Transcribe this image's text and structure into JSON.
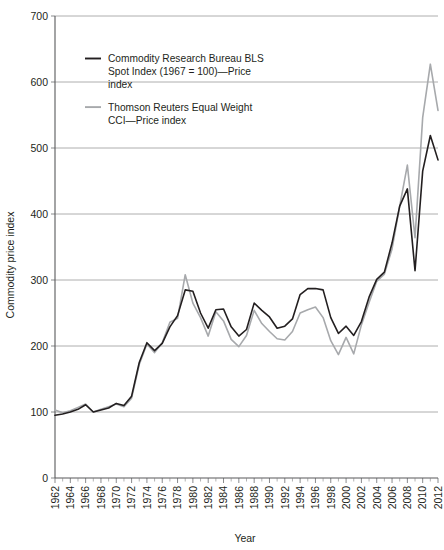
{
  "chart_data": {
    "type": "line",
    "title": "",
    "xlabel": "Year",
    "ylabel": "Commodity price index",
    "xlim": [
      1962,
      2012
    ],
    "ylim": [
      0,
      700
    ],
    "ytick_labels": [
      "0",
      "100",
      "200",
      "300",
      "400",
      "500",
      "600",
      "700"
    ],
    "ytick_values": [
      0,
      100,
      200,
      300,
      400,
      500,
      600,
      700
    ],
    "xtick_labels": [
      "1962",
      "1964",
      "1966",
      "1968",
      "1970",
      "1972",
      "1974",
      "1976",
      "1978",
      "1980",
      "1982",
      "1984",
      "1986",
      "1988",
      "1990",
      "1992",
      "1994",
      "1996",
      "1998",
      "2000",
      "2002",
      "2004",
      "2006",
      "2008",
      "2010",
      "2012"
    ],
    "xtick_values": [
      1962,
      1964,
      1966,
      1968,
      1970,
      1972,
      1974,
      1976,
      1978,
      1980,
      1982,
      1984,
      1986,
      1988,
      1990,
      1992,
      1994,
      1996,
      1998,
      2000,
      2002,
      2004,
      2006,
      2008,
      2010,
      2012
    ],
    "xtick_minor_values": [
      1963,
      1965,
      1967,
      1969,
      1971,
      1973,
      1975,
      1977,
      1979,
      1981,
      1983,
      1985,
      1987,
      1989,
      1991,
      1993,
      1995,
      1997,
      1999,
      2001,
      2003,
      2005,
      2007,
      2009,
      2011
    ],
    "grid": "horizontal",
    "legend_position": "top-left-inside",
    "x": [
      1962,
      1963,
      1964,
      1965,
      1966,
      1967,
      1968,
      1969,
      1970,
      1971,
      1972,
      1973,
      1974,
      1975,
      1976,
      1977,
      1978,
      1979,
      1980,
      1981,
      1982,
      1983,
      1984,
      1985,
      1986,
      1987,
      1988,
      1989,
      1990,
      1991,
      1992,
      1993,
      1994,
      1995,
      1996,
      1997,
      1998,
      1999,
      2000,
      2001,
      2002,
      2003,
      2004,
      2005,
      2006,
      2007,
      2008,
      2009,
      2010,
      2011,
      2012
    ],
    "series": [
      {
        "name": "Commodity Research Bureau BLS Spot Index (1967 = 100)—Price index",
        "color": "#231f20",
        "width": 1.6,
        "values": [
          95,
          97,
          100,
          104,
          111,
          100,
          103,
          106,
          113,
          110,
          124,
          175,
          205,
          193,
          204,
          229,
          246,
          285,
          283,
          250,
          227,
          255,
          256,
          229,
          215,
          225,
          265,
          254,
          244,
          227,
          230,
          241,
          278,
          287,
          287,
          285,
          243,
          219,
          230,
          216,
          237,
          274,
          301,
          312,
          356,
          412,
          438,
          314,
          465,
          519,
          482
        ]
      },
      {
        "name": "Thomson Reuters Equal Weight CCI—Price index",
        "color": "#a7a9ac",
        "width": 1.6,
        "values": [
          103,
          99,
          102,
          107,
          112,
          100,
          104,
          108,
          112,
          108,
          121,
          172,
          203,
          190,
          205,
          236,
          242,
          308,
          265,
          243,
          215,
          252,
          238,
          210,
          199,
          216,
          254,
          234,
          222,
          211,
          209,
          222,
          250,
          255,
          259,
          243,
          208,
          187,
          213,
          188,
          232,
          266,
          298,
          309,
          347,
          412,
          474,
          364,
          546,
          627,
          557
        ]
      }
    ],
    "legend": [
      {
        "line1": "Commodity Research Bureau BLS",
        "line2": "Spot Index (1967 = 100)—Price",
        "line3": "index",
        "color": "#231f20"
      },
      {
        "line1": "Thomson Reuters Equal Weight",
        "line2": "CCI—Price index",
        "line3": "",
        "color": "#a7a9ac"
      }
    ]
  }
}
